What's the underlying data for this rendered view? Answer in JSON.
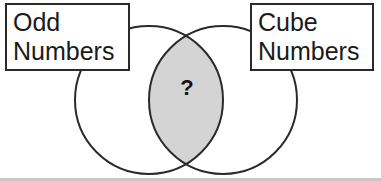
{
  "diagram": {
    "type": "venn",
    "sets": [
      {
        "id": "left",
        "label_lines": [
          "Odd",
          "Numbers"
        ]
      },
      {
        "id": "right",
        "label_lines": [
          "Cube",
          "Numbers"
        ]
      }
    ],
    "intersection": {
      "label": "?",
      "shaded": true,
      "fill_color": "#d4d4d4"
    },
    "stroke_color": "#2a2a2a"
  }
}
